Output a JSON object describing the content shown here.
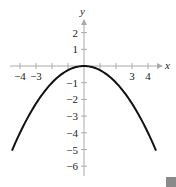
{
  "chart_data": {
    "type": "line",
    "title": "",
    "xlabel": "x",
    "ylabel": "y",
    "xlim": [
      -4.8,
      4.8
    ],
    "ylim": [
      -6.3,
      2.9
    ],
    "grid": false,
    "x_tick_labels": [
      "−4",
      "−3",
      "3",
      "4"
    ],
    "x_tick_values": [
      -4,
      -3,
      3,
      4
    ],
    "x_ticks_all": [
      -4,
      -3,
      -2,
      -1,
      1,
      2,
      3,
      4
    ],
    "y_tick_labels": [
      "2",
      "1",
      "−1",
      "−2",
      "−3",
      "−4",
      "−5",
      "−6"
    ],
    "y_tick_values": [
      2,
      1,
      -1,
      -2,
      -3,
      -4,
      -5,
      -6
    ],
    "series": [
      {
        "name": "parabola",
        "equation": "y = -x^2/4",
        "x": [
          -4.5,
          -4,
          -3,
          -2,
          -1,
          0,
          1,
          2,
          3,
          4,
          4.5
        ],
        "y": [
          -5.06,
          -4,
          -2.25,
          -1,
          -0.25,
          0,
          -0.25,
          -1,
          -2.25,
          -4,
          -5.06
        ],
        "color": "#111111"
      }
    ]
  },
  "labels": {
    "x_axis": "x",
    "y_axis": "y"
  },
  "decor": {
    "end_mark_color": "#8a8a8a"
  }
}
